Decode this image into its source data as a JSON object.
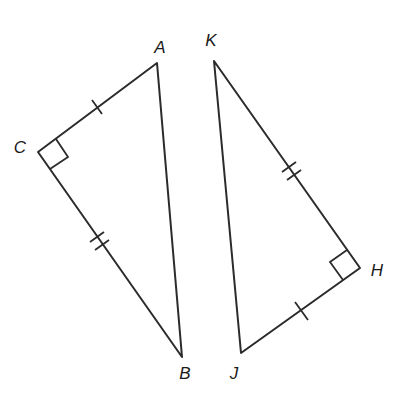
{
  "diagram": {
    "stroke_color": "#2b2b2b",
    "background": "#ffffff",
    "triangles": [
      {
        "name": "triangle-ABC",
        "vertices": {
          "A": {
            "label": "A",
            "x": 157,
            "y": 63,
            "label_x": 160,
            "label_y": 47
          },
          "B": {
            "label": "B",
            "x": 182,
            "y": 357,
            "label_x": 185,
            "label_y": 373
          },
          "C": {
            "label": "C",
            "x": 38,
            "y": 152,
            "label_x": 20,
            "label_y": 147
          }
        },
        "right_angle_at": "C",
        "right_angle_box": [
          [
            38,
            152
          ],
          [
            56,
            139
          ],
          [
            68,
            157
          ],
          [
            50,
            169
          ]
        ],
        "ticks": [
          {
            "segment": "CA",
            "count": 1
          },
          {
            "segment": "CB",
            "count": 2
          }
        ]
      },
      {
        "name": "triangle-KHJ",
        "vertices": {
          "K": {
            "label": "K",
            "x": 214,
            "y": 61,
            "label_x": 211,
            "label_y": 40
          },
          "H": {
            "label": "H",
            "x": 360,
            "y": 268,
            "label_x": 377,
            "label_y": 270
          },
          "J": {
            "label": "J",
            "x": 241,
            "y": 353,
            "label_x": 234,
            "label_y": 373
          }
        },
        "right_angle_at": "H",
        "right_angle_box": [
          [
            360,
            268
          ],
          [
            347,
            250
          ],
          [
            330,
            262
          ],
          [
            343,
            280
          ]
        ],
        "ticks": [
          {
            "segment": "KH",
            "count": 2
          },
          {
            "segment": "HJ",
            "count": 1
          }
        ]
      }
    ]
  },
  "labels": {
    "A": "A",
    "B": "B",
    "C": "C",
    "K": "K",
    "H": "H",
    "J": "J"
  }
}
